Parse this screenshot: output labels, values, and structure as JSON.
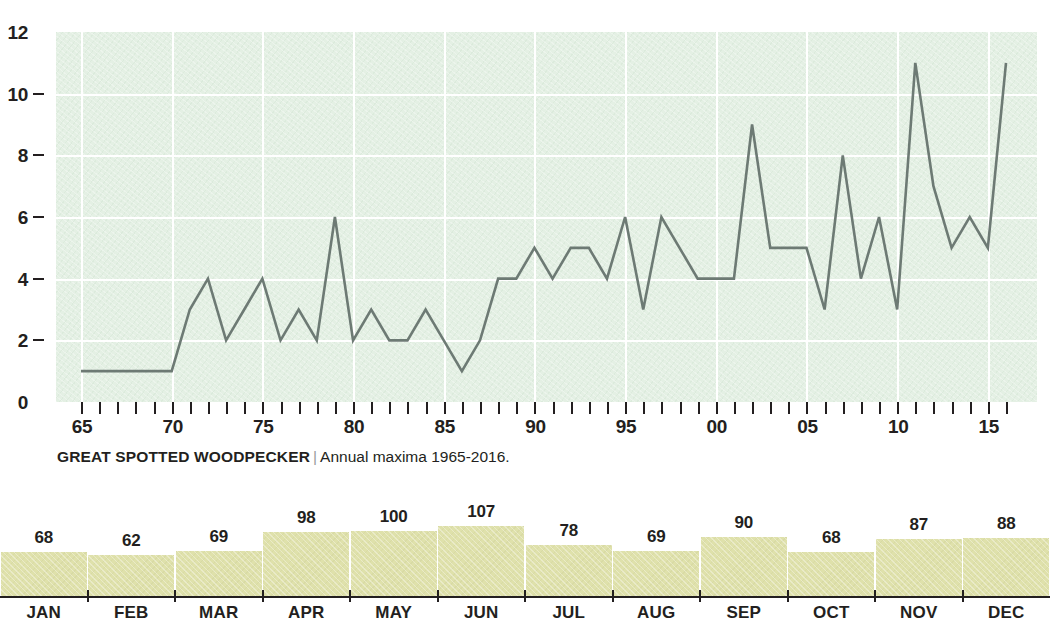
{
  "chart_data": [
    {
      "type": "line",
      "title": "GREAT SPOTTED WOODPECKER",
      "separator": "|",
      "subtitle": "Annual maxima 1965-2016.",
      "xlabel": "",
      "ylabel": "",
      "ylim": [
        0,
        12
      ],
      "xlim": [
        1965,
        2016
      ],
      "grid": true,
      "legend": "none",
      "line_color": "#6d7a74",
      "plot_background": "#e4f0e4",
      "gridline_color": "#ffffff",
      "y_ticks": [
        0,
        2,
        4,
        6,
        8,
        10,
        12
      ],
      "y_tick_labels": [
        "0",
        "2",
        "4",
        "6",
        "8",
        "10",
        "12"
      ],
      "x_tick_labels": [
        "65",
        "70",
        "75",
        "80",
        "85",
        "90",
        "95",
        "00",
        "05",
        "10",
        "15"
      ],
      "x_tick_years": [
        1965,
        1970,
        1975,
        1980,
        1985,
        1990,
        1995,
        2000,
        2005,
        2010,
        2015
      ],
      "x": [
        1965,
        1966,
        1967,
        1968,
        1969,
        1970,
        1971,
        1972,
        1973,
        1974,
        1975,
        1976,
        1977,
        1978,
        1979,
        1980,
        1981,
        1982,
        1983,
        1984,
        1985,
        1986,
        1987,
        1988,
        1989,
        1990,
        1991,
        1992,
        1993,
        1994,
        1995,
        1996,
        1997,
        1998,
        1999,
        2000,
        2001,
        2002,
        2003,
        2004,
        2005,
        2006,
        2007,
        2008,
        2009,
        2010,
        2011,
        2012,
        2013,
        2014,
        2015,
        2016
      ],
      "values": [
        1,
        1,
        1,
        1,
        1,
        1,
        3,
        4,
        2,
        3,
        4,
        2,
        3,
        2,
        6,
        2,
        3,
        2,
        2,
        3,
        2,
        1,
        2,
        4,
        4,
        5,
        4,
        5,
        5,
        4,
        6,
        3,
        6,
        5,
        4,
        4,
        4,
        9,
        5,
        5,
        5,
        3,
        8,
        4,
        6,
        3,
        11,
        7,
        5,
        6,
        5,
        11
      ]
    },
    {
      "type": "bar",
      "title": "",
      "xlabel": "",
      "ylabel": "",
      "grid": false,
      "legend": "none",
      "bar_color": "#dfe1ab",
      "ylim": [
        0,
        107
      ],
      "categories": [
        "JAN",
        "FEB",
        "MAR",
        "APR",
        "MAY",
        "JUN",
        "JUL",
        "AUG",
        "SEP",
        "OCT",
        "NOV",
        "DEC"
      ],
      "values": [
        68,
        62,
        69,
        98,
        100,
        107,
        78,
        69,
        90,
        68,
        87,
        88
      ]
    }
  ]
}
